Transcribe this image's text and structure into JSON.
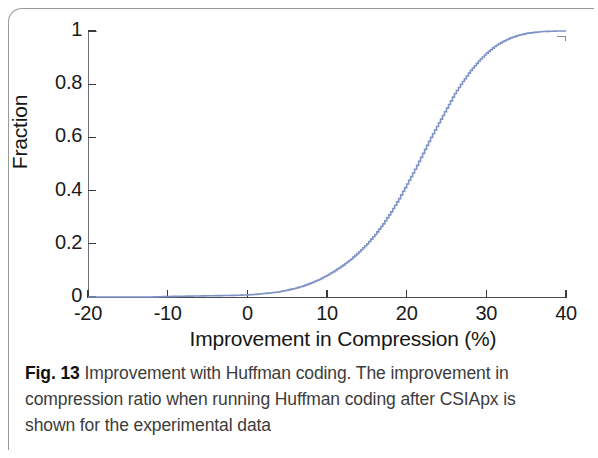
{
  "figure": {
    "caption_label": "Fig. 13",
    "caption_text": "Improvement with Huffman coding. The improvement in compression ratio when running Huffman coding after CSIApx is shown for the experimental data"
  },
  "colors": {
    "curve": "#7f93c4",
    "axis": "#3a3a42",
    "text": "#161616",
    "caption": "#3c3c3c",
    "frame": "#9a9a9a"
  },
  "chart_data": {
    "type": "line",
    "title": "",
    "subtitle": "",
    "xlabel": "Improvement in Compression (%)",
    "ylabel": "Fraction",
    "xlim": [
      -20,
      40
    ],
    "ylim": [
      0,
      1
    ],
    "xticks": [
      -20,
      -10,
      0,
      10,
      20,
      30,
      40
    ],
    "xtick_labels": [
      "-20",
      "-10",
      "0",
      "10",
      "20",
      "30",
      "40"
    ],
    "yticks": [
      0,
      0.2,
      0.4,
      0.6,
      0.8,
      1
    ],
    "ytick_labels": [
      "0",
      "0.2",
      "0.4",
      "0.6",
      "0.8",
      "1"
    ],
    "grid": false,
    "legend": null,
    "annotations": [],
    "series": [
      {
        "name": "CDF of compression improvement with Huffman coding",
        "style": "step",
        "color": "#7f93c4",
        "x": [
          -20,
          -18,
          -16,
          -14,
          -12,
          -10,
          -8,
          -6,
          -4,
          -2,
          0,
          1,
          2,
          3,
          4,
          5,
          6,
          7,
          8,
          9,
          10,
          11,
          12,
          13,
          14,
          15,
          16,
          17,
          18,
          19,
          20,
          21,
          22,
          23,
          24,
          25,
          26,
          27,
          28,
          29,
          30,
          31,
          32,
          33,
          34,
          35,
          36,
          37,
          38,
          39,
          40
        ],
        "y": [
          0.0,
          0.0,
          0.0,
          0.0,
          0.0,
          0.002,
          0.003,
          0.004,
          0.005,
          0.006,
          0.008,
          0.01,
          0.013,
          0.016,
          0.02,
          0.026,
          0.033,
          0.042,
          0.053,
          0.066,
          0.082,
          0.1,
          0.12,
          0.143,
          0.17,
          0.2,
          0.235,
          0.275,
          0.32,
          0.37,
          0.425,
          0.48,
          0.54,
          0.6,
          0.655,
          0.71,
          0.765,
          0.81,
          0.852,
          0.887,
          0.917,
          0.942,
          0.96,
          0.974,
          0.984,
          0.991,
          0.995,
          0.998,
          0.999,
          1.0,
          1.0
        ]
      }
    ]
  }
}
